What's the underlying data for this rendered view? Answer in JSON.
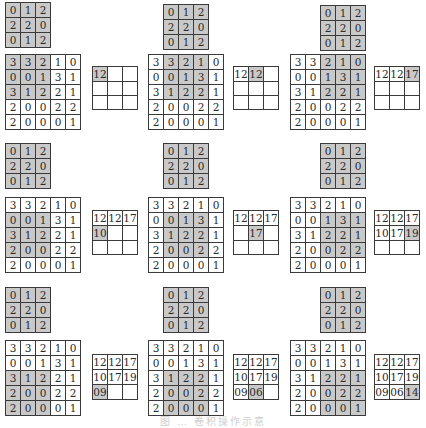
{
  "figure": {
    "kernel": [
      [
        0,
        1,
        2
      ],
      [
        2,
        2,
        0
      ],
      [
        0,
        1,
        2
      ]
    ],
    "input": [
      [
        3,
        3,
        2,
        1,
        0
      ],
      [
        0,
        0,
        1,
        3,
        1
      ],
      [
        3,
        1,
        2,
        2,
        1
      ],
      [
        2,
        0,
        0,
        2,
        2
      ],
      [
        2,
        0,
        0,
        0,
        1
      ]
    ],
    "steps": [
      {
        "row": 0,
        "col": 0,
        "output": [
          [
            "12",
            "",
            ""
          ],
          [
            "",
            "",
            ""
          ],
          [
            "",
            "",
            ""
          ]
        ],
        "highlight": [
          0,
          0
        ]
      },
      {
        "row": 0,
        "col": 1,
        "output": [
          [
            "12",
            "12",
            ""
          ],
          [
            "",
            "",
            ""
          ],
          [
            "",
            "",
            ""
          ]
        ],
        "highlight": [
          0,
          1
        ]
      },
      {
        "row": 0,
        "col": 2,
        "output": [
          [
            "12",
            "12",
            "17"
          ],
          [
            "",
            "",
            ""
          ],
          [
            "",
            "",
            ""
          ]
        ],
        "highlight": [
          0,
          2
        ]
      },
      {
        "row": 1,
        "col": 0,
        "output": [
          [
            "12",
            "12",
            "17"
          ],
          [
            "10",
            "",
            ""
          ],
          [
            "",
            "",
            ""
          ]
        ],
        "highlight": [
          1,
          0
        ]
      },
      {
        "row": 1,
        "col": 1,
        "output": [
          [
            "12",
            "12",
            "17"
          ],
          [
            "",
            "17",
            ""
          ],
          [
            "",
            "",
            ""
          ]
        ],
        "highlight": [
          1,
          1
        ]
      },
      {
        "row": 1,
        "col": 2,
        "output": [
          [
            "12",
            "12",
            "17"
          ],
          [
            "10",
            "17",
            "19"
          ],
          [
            "",
            "",
            ""
          ]
        ],
        "highlight": [
          1,
          2
        ]
      },
      {
        "row": 2,
        "col": 0,
        "output": [
          [
            "12",
            "12",
            "17"
          ],
          [
            "10",
            "17",
            "19"
          ],
          [
            "09",
            "",
            ""
          ]
        ],
        "highlight": [
          2,
          0
        ]
      },
      {
        "row": 2,
        "col": 1,
        "output": [
          [
            "12",
            "12",
            "17"
          ],
          [
            "10",
            "17",
            "19"
          ],
          [
            "09",
            "06",
            ""
          ]
        ],
        "highlight": [
          2,
          1
        ]
      },
      {
        "row": 2,
        "col": 2,
        "output": [
          [
            "12",
            "12",
            "17"
          ],
          [
            "10",
            "17",
            "19"
          ],
          [
            "09",
            "06",
            "14"
          ]
        ],
        "highlight": [
          2,
          2
        ]
      }
    ],
    "caption": "图 … 卷积操作示意"
  },
  "colors": {
    "highlight": "#c9c9c9",
    "border": "#3a3a3a",
    "text": "#2a2a2a"
  }
}
